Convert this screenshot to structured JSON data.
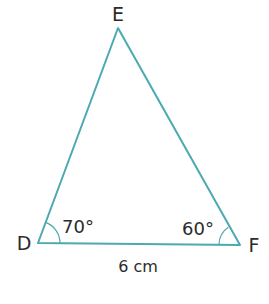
{
  "diagram": {
    "type": "triangle",
    "colors": {
      "line": "#4ba9b1",
      "text": "#2b2b2b"
    },
    "vertices": [
      {
        "id": "E",
        "label": "E",
        "x": 118,
        "y": 28
      },
      {
        "id": "D",
        "label": "D",
        "x": 38,
        "y": 243
      },
      {
        "id": "F",
        "label": "F",
        "x": 240,
        "y": 245
      }
    ],
    "angles": [
      {
        "vertex": "D",
        "label": "70°"
      },
      {
        "vertex": "F",
        "label": "60°"
      }
    ],
    "sides": [
      {
        "from": "D",
        "to": "F",
        "label": "6 cm"
      }
    ]
  }
}
